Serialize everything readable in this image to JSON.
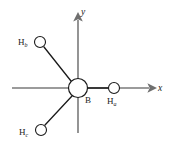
{
  "figure": {
    "background_color": "#ffffff",
    "width": 171,
    "height": 155
  },
  "axes": {
    "stroke_color": "#7a7a7a",
    "stroke_width": 1.6,
    "x_axis": {
      "label": "x",
      "label_x": 158,
      "label_y": 91,
      "start_x": 12,
      "start_y": 88,
      "end_x": 149,
      "end_y": 88,
      "arrow": "right"
    },
    "y_axis": {
      "label": "y",
      "label_x": 81,
      "label_y": 15,
      "start_x": 78,
      "start_y": 133,
      "end_x": 78,
      "end_y": 20,
      "arrow": "up"
    }
  },
  "molecule": {
    "bond_color": "#1a1a1a",
    "bond_width": 1.3,
    "atom_stroke_color": "#1a1a1a",
    "atom_fill_color": "#ffffff",
    "atoms": [
      {
        "id": "boron-center",
        "element": "B",
        "label": "B",
        "subscript": "",
        "cx": 78,
        "cy": 88,
        "r": 9.5,
        "label_x": 85,
        "label_y": 103
      },
      {
        "id": "hydrogen-a",
        "element": "H",
        "label": "H",
        "subscript": "a",
        "cx": 114,
        "cy": 88,
        "r": 5.5,
        "label_x": 107,
        "label_y": 104
      },
      {
        "id": "hydrogen-b",
        "element": "H",
        "label": "H",
        "subscript": "b",
        "cx": 40,
        "cy": 42,
        "r": 5.5,
        "label_x": 18,
        "label_y": 45
      },
      {
        "id": "hydrogen-c",
        "element": "H",
        "label": "H",
        "subscript": "c",
        "cx": 41,
        "cy": 130,
        "r": 5.5,
        "label_x": 19,
        "label_y": 135
      }
    ],
    "bonds": [
      {
        "id": "bond-b-ha",
        "from": "boron-center",
        "to": "hydrogen-a",
        "x1": 88,
        "y1": 88,
        "x2": 108,
        "y2": 88
      },
      {
        "id": "bond-b-hb",
        "from": "boron-center",
        "to": "hydrogen-b",
        "x1": 71,
        "y1": 81,
        "x2": 44,
        "y2": 47
      },
      {
        "id": "bond-b-hc",
        "from": "boron-center",
        "to": "hydrogen-c",
        "x1": 72,
        "y1": 96,
        "x2": 45,
        "y2": 125
      }
    ]
  }
}
